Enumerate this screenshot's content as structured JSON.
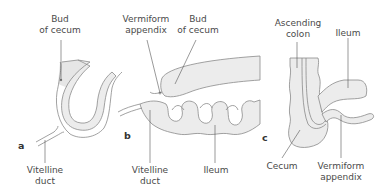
{
  "figure": {
    "panels": [
      {
        "letter": "a",
        "labels": {
          "bud_line1": "Bud",
          "bud_line2": "of cecum",
          "vit_line1": "Vitelline",
          "vit_line2": "duct"
        }
      },
      {
        "letter": "b",
        "labels": {
          "verm_line1": "Vermiform",
          "verm_line2": "appendix",
          "bud_line1": "Bud",
          "bud_line2": "of cecum",
          "vit_line1": "Vitelline",
          "vit_line2": "duct",
          "ileum": "Ileum"
        }
      },
      {
        "letter": "c",
        "labels": {
          "asc_line1": "Ascending",
          "asc_line2": "colon",
          "ileum": "Ileum",
          "cecum": "Cecum",
          "verm_line1": "Vermiform",
          "verm_line2": "appendix"
        }
      }
    ],
    "colors": {
      "fill": "#ececec",
      "stroke": "#8a8a8a",
      "leader": "#555555",
      "text": "#4a4a4a"
    }
  }
}
